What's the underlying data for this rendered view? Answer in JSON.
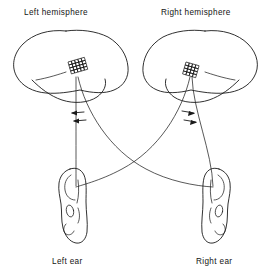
{
  "figure": {
    "background_color": "#ffffff",
    "ink_color": "#1a1a1a",
    "labels": {
      "left_hemisphere": "Left hemisphere",
      "right_hemisphere": "Right hemisphere",
      "left_ear": "Left ear",
      "right_ear": "Right ear"
    },
    "regions": {
      "left_auditory_cortex": "cross-hatched-patch",
      "right_auditory_cortex": "cross-hatched-patch"
    },
    "pathways": [
      {
        "name": "left-ear-to-left-hemisphere",
        "type": "ipsilateral",
        "style": "straight"
      },
      {
        "name": "right-ear-to-right-hemisphere",
        "type": "ipsilateral",
        "style": "straight"
      },
      {
        "name": "left-ear-to-right-hemisphere",
        "type": "contralateral",
        "style": "curved-crossing"
      },
      {
        "name": "right-ear-to-left-hemisphere",
        "type": "contralateral",
        "style": "curved-crossing"
      }
    ],
    "arrows": {
      "left_group_direction": "left",
      "left_group_count": 2,
      "right_group_direction": "right",
      "right_group_count": 2
    }
  }
}
